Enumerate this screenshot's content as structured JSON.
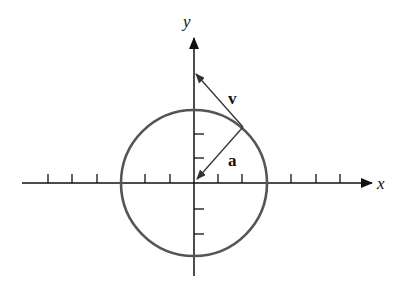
{
  "diagram": {
    "title": "",
    "axes": {
      "x_label": "x",
      "y_label": "y"
    },
    "circle": {
      "center": [
        194,
        183
      ],
      "radius": 73,
      "color": "#555555"
    },
    "vectors": [
      {
        "name": "v",
        "label": "v",
        "from": [
          243,
          127
        ],
        "to": [
          194,
          73
        ],
        "description": "tangent velocity vector"
      },
      {
        "name": "a",
        "label": "a",
        "from": [
          243,
          127
        ],
        "to": [
          196,
          180
        ],
        "description": "centripetal acceleration vector"
      }
    ],
    "tick_spacing": 24.5,
    "colors": {
      "axis": "#111111",
      "circle": "#555555",
      "vector": "#333333"
    }
  }
}
